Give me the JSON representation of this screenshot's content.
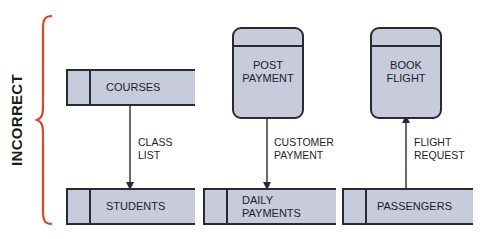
{
  "side_label": "INCORRECT",
  "colors": {
    "bracket": "#d9472b",
    "shape_fill": "#c8cbdc",
    "stroke": "#2a2a30",
    "text": "#1e1e24"
  },
  "diagrams": [
    {
      "source": {
        "type": "data-store",
        "label": "COURSES"
      },
      "flow": {
        "label_line1": "CLASS",
        "label_line2": "LIST",
        "direction": "down"
      },
      "target": {
        "type": "data-store",
        "label": "STUDENTS"
      }
    },
    {
      "source": {
        "type": "process",
        "label_line1": "POST",
        "label_line2": "PAYMENT"
      },
      "flow": {
        "label_line1": "CUSTOMER",
        "label_line2": "PAYMENT",
        "direction": "down"
      },
      "target": {
        "type": "data-store",
        "label_line1": "DAILY",
        "label_line2": "PAYMENTS"
      }
    },
    {
      "source": {
        "type": "data-store",
        "label": "PASSENGERS"
      },
      "flow": {
        "label_line1": "FLIGHT",
        "label_line2": "REQUEST",
        "direction": "up"
      },
      "target": {
        "type": "process",
        "label_line1": "BOOK",
        "label_line2": "FLIGHT"
      }
    }
  ]
}
